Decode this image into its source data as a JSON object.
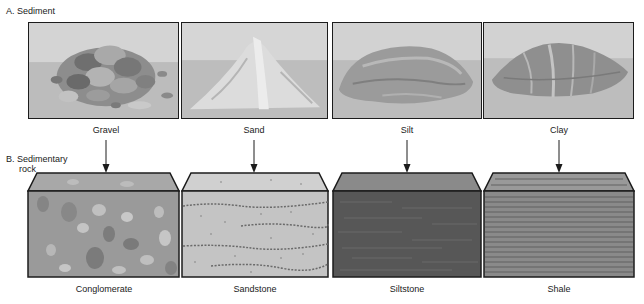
{
  "section_a": {
    "label": "A. Sediment"
  },
  "section_b": {
    "label_line1": "B. Sedimentary",
    "label_line2": "rock"
  },
  "sediments": [
    {
      "name": "Gravel",
      "pile": "gravel-pile"
    },
    {
      "name": "Sand",
      "pile": "sand-pile"
    },
    {
      "name": "Silt",
      "pile": "silt-pile"
    },
    {
      "name": "Clay",
      "pile": "clay-pile"
    }
  ],
  "rocks": [
    {
      "name": "Conglomerate",
      "texture": "pebbles"
    },
    {
      "name": "Sandstone",
      "texture": "speckled-bands"
    },
    {
      "name": "Siltstone",
      "texture": "dark-fine-streaks"
    },
    {
      "name": "Shale",
      "texture": "thin-laminations"
    }
  ],
  "colors": {
    "outline": "#1c1c1c",
    "sky": "#d2d2d2",
    "ground": "#bdbdbd",
    "conglomerate": "#9a9a9a",
    "sandstone": "#c4c4c4",
    "siltstone": "#5a5a5a",
    "shale": "#8a8a8a"
  }
}
